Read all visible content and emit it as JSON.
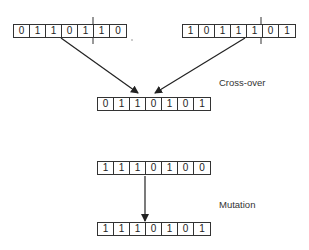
{
  "diagram": {
    "crossover": {
      "label": "Cross-over",
      "parent_a": [
        "0",
        "1",
        "1",
        "0",
        "1",
        "1",
        "0"
      ],
      "parent_b": [
        "1",
        "0",
        "1",
        "1",
        "1",
        "0",
        "1"
      ],
      "cut_point_after_gene": 5,
      "child": [
        "0",
        "1",
        "1",
        "0",
        "1",
        "0",
        "1"
      ]
    },
    "mutation": {
      "label": "Mutation",
      "before": [
        "1",
        "1",
        "1",
        "0",
        "1",
        "0",
        "0"
      ],
      "after": [
        "1",
        "1",
        "1",
        "0",
        "1",
        "0",
        "1"
      ]
    }
  },
  "colors": {
    "line": "#333333",
    "text": "#222222",
    "background": "#ffffff"
  }
}
